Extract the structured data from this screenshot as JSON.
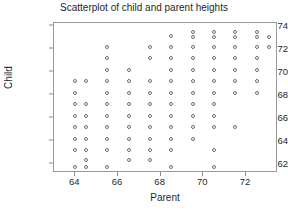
{
  "chart_data": {
    "type": "scatter",
    "title": "Scatterplot of child and parent heights",
    "xlabel": "Parent",
    "ylabel": "Child",
    "xlim": [
      63.0,
      73.5
    ],
    "ylim": [
      61.2,
      74.3
    ],
    "xticks": [
      64,
      66,
      68,
      70,
      72
    ],
    "xtick_labels": [
      "64",
      "66",
      "68",
      "70",
      "72"
    ],
    "yticks": [
      62,
      64,
      66,
      68,
      70,
      72,
      74
    ],
    "ytick_labels": [
      "62",
      "64",
      "66",
      "68",
      "70",
      "72",
      "74"
    ],
    "grid": false,
    "legend": false,
    "marker": "open-circle",
    "marker_color": "#6e6e6e",
    "frame_color": "#9a9a9a",
    "points": [
      {
        "x": 64.0,
        "y": 69.2
      },
      {
        "x": 64.0,
        "y": 68.2
      },
      {
        "x": 64.0,
        "y": 67.2
      },
      {
        "x": 64.0,
        "y": 66.2
      },
      {
        "x": 64.0,
        "y": 65.2
      },
      {
        "x": 64.0,
        "y": 64.2
      },
      {
        "x": 64.0,
        "y": 63.2
      },
      {
        "x": 64.0,
        "y": 61.7
      },
      {
        "x": 64.5,
        "y": 69.2
      },
      {
        "x": 64.5,
        "y": 67.2
      },
      {
        "x": 64.5,
        "y": 66.2
      },
      {
        "x": 64.5,
        "y": 65.2
      },
      {
        "x": 64.5,
        "y": 64.2
      },
      {
        "x": 64.5,
        "y": 63.2
      },
      {
        "x": 64.5,
        "y": 62.3
      },
      {
        "x": 64.5,
        "y": 61.7
      },
      {
        "x": 65.5,
        "y": 72.2
      },
      {
        "x": 65.5,
        "y": 71.2
      },
      {
        "x": 65.5,
        "y": 70.2
      },
      {
        "x": 65.5,
        "y": 69.2
      },
      {
        "x": 65.5,
        "y": 68.2
      },
      {
        "x": 65.5,
        "y": 67.2
      },
      {
        "x": 65.5,
        "y": 66.2
      },
      {
        "x": 65.5,
        "y": 65.2
      },
      {
        "x": 65.5,
        "y": 64.2
      },
      {
        "x": 65.5,
        "y": 63.2
      },
      {
        "x": 65.5,
        "y": 61.7
      },
      {
        "x": 66.5,
        "y": 70.2
      },
      {
        "x": 66.5,
        "y": 69.2
      },
      {
        "x": 66.5,
        "y": 68.2
      },
      {
        "x": 66.5,
        "y": 67.2
      },
      {
        "x": 66.5,
        "y": 66.2
      },
      {
        "x": 66.5,
        "y": 65.2
      },
      {
        "x": 66.5,
        "y": 64.2
      },
      {
        "x": 66.5,
        "y": 63.2
      },
      {
        "x": 66.5,
        "y": 62.3
      },
      {
        "x": 67.5,
        "y": 72.2
      },
      {
        "x": 67.5,
        "y": 71.2
      },
      {
        "x": 67.5,
        "y": 69.2
      },
      {
        "x": 67.5,
        "y": 68.2
      },
      {
        "x": 67.5,
        "y": 67.2
      },
      {
        "x": 67.5,
        "y": 66.2
      },
      {
        "x": 67.5,
        "y": 65.2
      },
      {
        "x": 67.5,
        "y": 64.2
      },
      {
        "x": 67.5,
        "y": 63.2
      },
      {
        "x": 67.5,
        "y": 62.3
      },
      {
        "x": 68.5,
        "y": 73.2
      },
      {
        "x": 68.5,
        "y": 72.2
      },
      {
        "x": 68.5,
        "y": 71.2
      },
      {
        "x": 68.5,
        "y": 70.2
      },
      {
        "x": 68.5,
        "y": 69.2
      },
      {
        "x": 68.5,
        "y": 68.2
      },
      {
        "x": 68.5,
        "y": 67.2
      },
      {
        "x": 68.5,
        "y": 66.2
      },
      {
        "x": 68.5,
        "y": 65.2
      },
      {
        "x": 68.5,
        "y": 64.2
      },
      {
        "x": 68.5,
        "y": 63.2
      },
      {
        "x": 68.5,
        "y": 61.7
      },
      {
        "x": 69.5,
        "y": 73.5
      },
      {
        "x": 69.5,
        "y": 73.1
      },
      {
        "x": 69.5,
        "y": 72.2
      },
      {
        "x": 69.5,
        "y": 71.2
      },
      {
        "x": 69.5,
        "y": 70.2
      },
      {
        "x": 69.5,
        "y": 69.2
      },
      {
        "x": 69.5,
        "y": 68.2
      },
      {
        "x": 69.5,
        "y": 67.2
      },
      {
        "x": 69.5,
        "y": 66.2
      },
      {
        "x": 69.5,
        "y": 65.2
      },
      {
        "x": 69.5,
        "y": 64.2
      },
      {
        "x": 70.5,
        "y": 73.5
      },
      {
        "x": 70.5,
        "y": 73.1
      },
      {
        "x": 70.5,
        "y": 72.2
      },
      {
        "x": 70.5,
        "y": 71.2
      },
      {
        "x": 70.5,
        "y": 70.2
      },
      {
        "x": 70.5,
        "y": 69.2
      },
      {
        "x": 70.5,
        "y": 68.2
      },
      {
        "x": 70.5,
        "y": 67.2
      },
      {
        "x": 70.5,
        "y": 66.2
      },
      {
        "x": 70.5,
        "y": 65.2
      },
      {
        "x": 70.5,
        "y": 63.2
      },
      {
        "x": 70.5,
        "y": 61.7
      },
      {
        "x": 71.5,
        "y": 73.5
      },
      {
        "x": 71.5,
        "y": 73.1
      },
      {
        "x": 71.5,
        "y": 72.2
      },
      {
        "x": 71.5,
        "y": 71.2
      },
      {
        "x": 71.5,
        "y": 70.2
      },
      {
        "x": 71.5,
        "y": 69.2
      },
      {
        "x": 71.5,
        "y": 68.2
      },
      {
        "x": 71.5,
        "y": 65.2
      },
      {
        "x": 72.5,
        "y": 73.5
      },
      {
        "x": 72.5,
        "y": 73.1
      },
      {
        "x": 72.5,
        "y": 72.2
      },
      {
        "x": 72.5,
        "y": 71.2
      },
      {
        "x": 72.5,
        "y": 70.2
      },
      {
        "x": 72.5,
        "y": 69.2
      },
      {
        "x": 72.5,
        "y": 68.2
      },
      {
        "x": 73.1,
        "y": 73.1
      },
      {
        "x": 73.1,
        "y": 72.2
      }
    ]
  }
}
